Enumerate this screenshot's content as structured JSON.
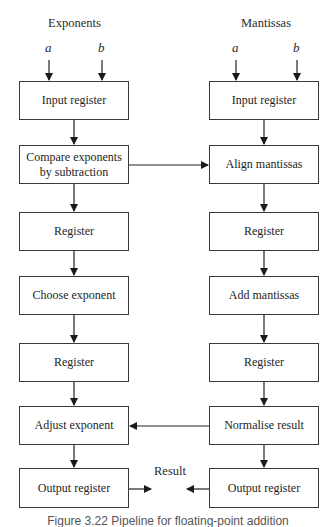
{
  "columns": {
    "left": {
      "title": "Exponents",
      "inputs": [
        "a",
        "b"
      ]
    },
    "right": {
      "title": "Mantissas",
      "inputs": [
        "a",
        "b"
      ]
    }
  },
  "left_boxes": [
    "Input register",
    "Compare exponents\nby subtraction",
    "Register",
    "Choose exponent",
    "Register",
    "Adjust exponent",
    "Output register"
  ],
  "right_boxes": [
    "Input register",
    "Align mantissas",
    "Register",
    "Add mantissas",
    "Register",
    "Normalise result",
    "Output register"
  ],
  "result_label": "Result",
  "caption": "Figure 3.22 Pipeline for floating-point addition",
  "colors": {
    "line": "#222222",
    "box_border": "#3a3a3a",
    "background": "#ffffff"
  }
}
